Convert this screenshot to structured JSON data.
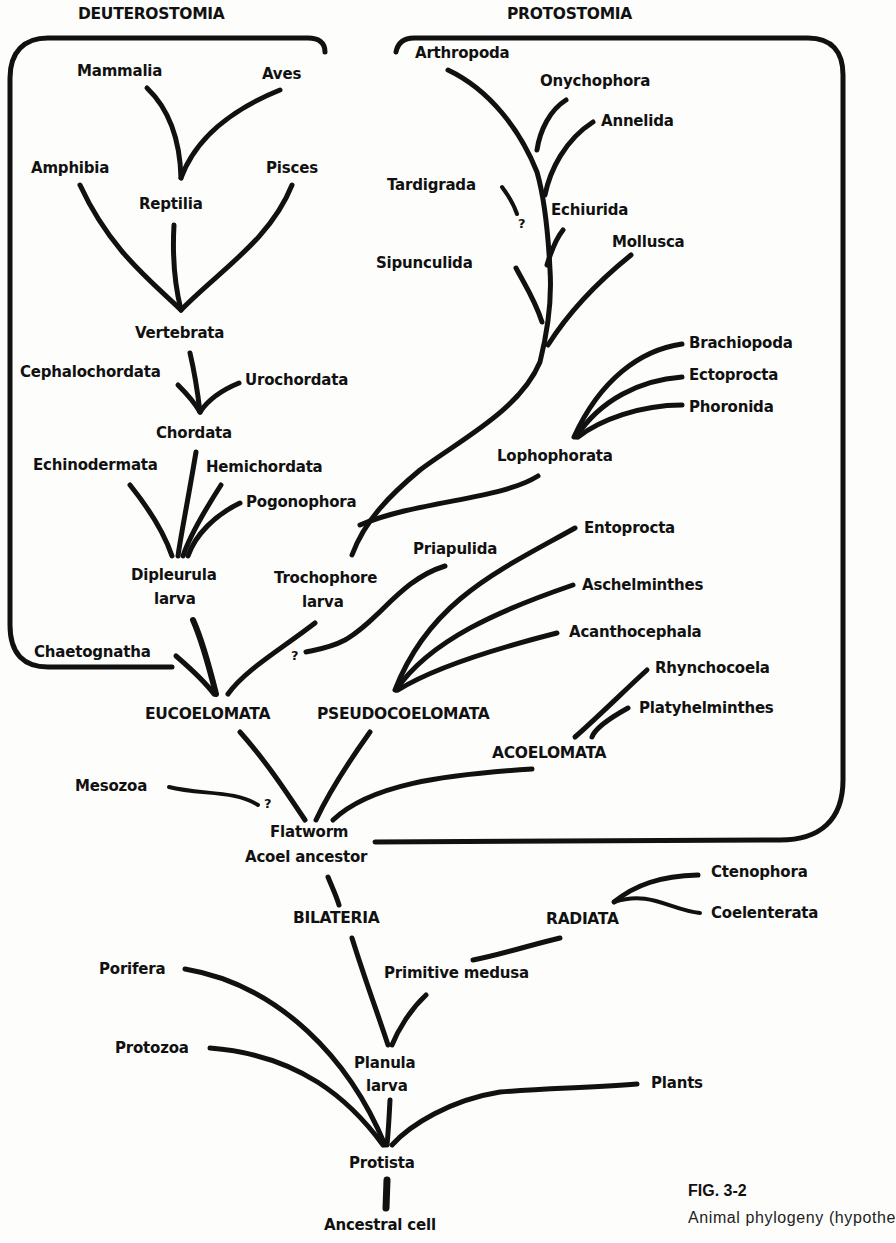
{
  "figure": {
    "number": "FIG. 3-2",
    "caption_visible": "Animal phylogeny (hypothe",
    "caption_line2_partial": "       "
  },
  "groups": {
    "deuterostomia": "DEUTEROSTOMIA",
    "protostomia": "PROTOSTOMIA",
    "eucoelomata": "EUCOELOMATA",
    "pseudocoelomata": "PSEUDOCOELOMATA",
    "acoelomata": "ACOELOMATA",
    "bilateria": "BILATERIA",
    "radiata": "RADIATA"
  },
  "deuterostome_taxa": {
    "mammalia": "Mammalia",
    "aves": "Aves",
    "amphibia": "Amphibia",
    "pisces": "Pisces",
    "reptilia": "Reptilia",
    "vertebrata": "Vertebrata",
    "cephalochordata": "Cephalochordata",
    "urochordata": "Urochordata",
    "chordata": "Chordata",
    "echinodermata": "Echinodermata",
    "hemichordata": "Hemichordata",
    "pogonophora": "Pogonophora",
    "dipleurula_1": "Dipleurula",
    "dipleurula_2": "larva",
    "chaetognatha": "Chaetognatha"
  },
  "protostome_taxa": {
    "arthropoda": "Arthropoda",
    "onychophora": "Onychophora",
    "annelida": "Annelida",
    "tardigrada": "Tardigrada",
    "echiurida": "Echiurida",
    "sipunculida": "Sipunculida",
    "mollusca": "Mollusca",
    "brachiopoda": "Brachiopoda",
    "ectoprocta": "Ectoprocta",
    "phoronida": "Phoronida",
    "lophophorata": "Lophophorata",
    "trochophore_1": "Trochophore",
    "trochophore_2": "larva",
    "priapulida": "Priapulida",
    "entoprocta": "Entoprocta",
    "aschelminthes": "Aschelminthes",
    "acanthocephala": "Acanthocephala",
    "rhynchocoela": "Rhynchocoela",
    "platyhelminthes": "Platyhelminthes"
  },
  "base_taxa": {
    "mesozoa": "Mesozoa",
    "flatworm_1": "Flatworm",
    "flatworm_2": "Acoel ancestor",
    "ctenophora": "Ctenophora",
    "coelenterata": "Coelenterata",
    "primitive_medusa": "Primitive medusa",
    "porifera": "Porifera",
    "protozoa": "Protozoa",
    "planula_1": "Planula",
    "planula_2": "larva",
    "plants": "Plants",
    "protista": "Protista",
    "ancestral_cell": "Ancestral cell"
  },
  "uncertain_marks": {
    "mark": "?"
  },
  "colors": {
    "ink": "#111111",
    "paper": "#fdfdfb"
  }
}
